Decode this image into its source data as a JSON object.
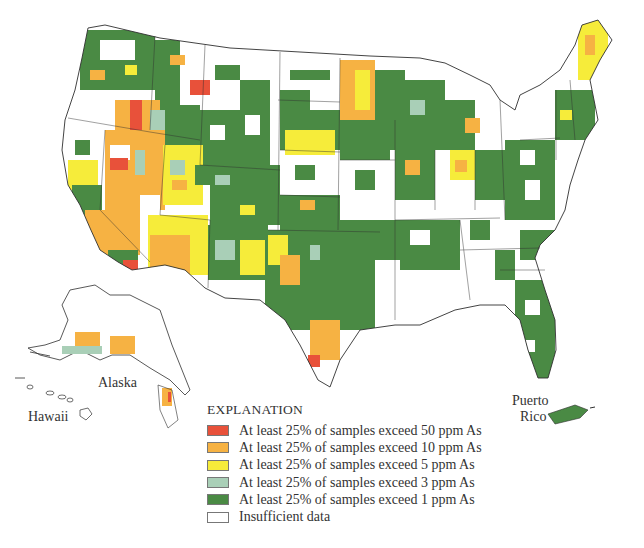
{
  "map": {
    "title": "Arsenic concentrations in ground water (county-level)",
    "regions_labeled": {
      "alaska": "Alaska",
      "hawaii": "Hawaii",
      "puerto_rico_line1": "Puerto",
      "puerto_rico_line2": "Rico"
    },
    "colors": {
      "exceed_50": "#e8513a",
      "exceed_10": "#f6b243",
      "exceed_5": "#f6ec3a",
      "exceed_3": "#a9cfb7",
      "exceed_1": "#4a8a44",
      "insufficient": "#ffffff",
      "border": "#2f2f2f"
    }
  },
  "legend": {
    "title": "EXPLANATION",
    "items": [
      {
        "label": "At least 25% of samples exceed 50 ppm As",
        "color": "#e8513a"
      },
      {
        "label": "At least 25% of samples exceed 10 ppm As",
        "color": "#f6b243"
      },
      {
        "label": "At least 25% of samples exceed 5 ppm As",
        "color": "#f6ec3a"
      },
      {
        "label": "At least 25% of samples exceed 3 ppm As",
        "color": "#a9cfb7"
      },
      {
        "label": "At least 25% of samples exceed 1 ppm As",
        "color": "#4a8a44"
      },
      {
        "label": "Insufficient data",
        "color": "#ffffff"
      }
    ]
  }
}
